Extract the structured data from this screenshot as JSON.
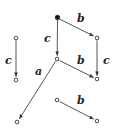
{
  "diagram": {
    "type": "directed-graph",
    "nodes": [
      {
        "id": "n0",
        "x": 57.5,
        "y": 17.5,
        "filled": true
      },
      {
        "id": "n1",
        "x": 97,
        "y": 38,
        "filled": false
      },
      {
        "id": "n2",
        "x": 57,
        "y": 59,
        "filled": false
      },
      {
        "id": "n3",
        "x": 97,
        "y": 79,
        "filled": false
      },
      {
        "id": "n4",
        "x": 16,
        "y": 38,
        "filled": false
      },
      {
        "id": "n5",
        "x": 16,
        "y": 80,
        "filled": false
      },
      {
        "id": "n6",
        "x": 17,
        "y": 122,
        "filled": false
      },
      {
        "id": "n7",
        "x": 57,
        "y": 100,
        "filled": false
      },
      {
        "id": "n8",
        "x": 97,
        "y": 121,
        "filled": false
      }
    ],
    "edges": [
      {
        "from": "n0",
        "to": "n1",
        "label": "b"
      },
      {
        "from": "n0",
        "to": "n2",
        "label": "c"
      },
      {
        "from": "n1",
        "to": "n3",
        "label": "c"
      },
      {
        "from": "n2",
        "to": "n3",
        "label": "b"
      },
      {
        "from": "n4",
        "to": "n5",
        "label": "c"
      },
      {
        "from": "n2",
        "to": "n6",
        "label": "a"
      },
      {
        "from": "n7",
        "to": "n8",
        "label": "b"
      }
    ],
    "labels": {
      "e0": "b",
      "e1": "c",
      "e2": "c",
      "e3": "b",
      "e4": "c",
      "e5": "a",
      "e6": "b"
    },
    "colors": {
      "stroke": "#333333",
      "node_fill_start": "#111111",
      "node_fill": "#ffffff"
    }
  }
}
